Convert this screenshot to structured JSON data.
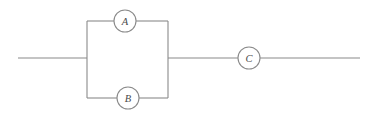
{
  "diagram": {
    "type": "electrical-circuit",
    "title": "",
    "background_color": "#ffffff",
    "line_color": "#8a8a8a",
    "label_color": "#4a4a4a",
    "canvas": {
      "width": 377,
      "height": 117
    },
    "topology": "Two components A and B in parallel, that combination in series with component C",
    "components": [
      {
        "id": "A",
        "label": "A",
        "shape": "circle",
        "branch": "top-parallel-branch",
        "cx": 125,
        "cy": 21,
        "r": 11
      },
      {
        "id": "B",
        "label": "B",
        "shape": "circle",
        "branch": "bottom-parallel-branch",
        "cx": 128,
        "cy": 98,
        "r": 11
      },
      {
        "id": "C",
        "label": "C",
        "shape": "circle",
        "branch": "series-branch",
        "cx": 249,
        "cy": 58,
        "r": 11
      }
    ],
    "wires": [
      {
        "id": "left-lead",
        "d": "M 18 58 L 87 58"
      },
      {
        "id": "left-rail",
        "d": "M 87 21 L 87 98"
      },
      {
        "id": "top-branch-left",
        "d": "M 87 21 L 114 21"
      },
      {
        "id": "top-branch-right",
        "d": "M 136 21 L 168 21"
      },
      {
        "id": "bottom-branch-left",
        "d": "M 87 98 L 117 98"
      },
      {
        "id": "bottom-branch-right",
        "d": "M 139 98 L 168 98"
      },
      {
        "id": "right-rail",
        "d": "M 168 21 L 168 98"
      },
      {
        "id": "middle-lead",
        "d": "M 168 58 L 238 58"
      },
      {
        "id": "right-lead",
        "d": "M 260 58 L 360 58"
      }
    ]
  }
}
